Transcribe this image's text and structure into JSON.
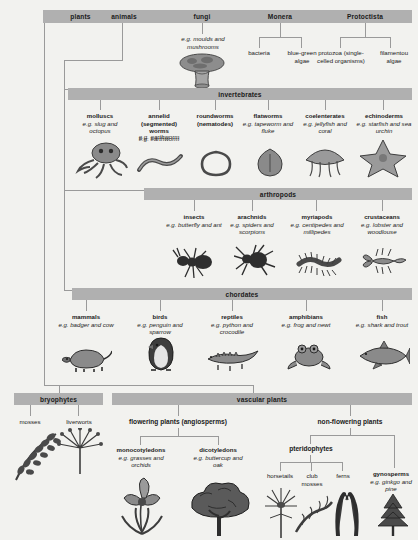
{
  "diagram": {
    "bar_color": "#b0b0b0",
    "background_color": "#f2f2ef",
    "line_color": "#9a9a9a"
  },
  "kingdoms": {
    "plants": "plants",
    "animals": "animals",
    "fungi": "fungi",
    "monera": "Monera",
    "protoctista": "Protoctista"
  },
  "fungi": {
    "example": "e.g. moulds and mushrooms",
    "art": "mushroom-illustration"
  },
  "monera": {
    "children": [
      {
        "name": "bacteria"
      },
      {
        "name": "blue-green algae"
      }
    ]
  },
  "protoctista": {
    "children": [
      {
        "name": "protozoa (single-celled organisms)"
      },
      {
        "name": "filamentou algae"
      }
    ]
  },
  "invertebrates": {
    "heading": "invertebrates",
    "groups": [
      {
        "name": "molluscs",
        "example": "e.g. slug and octopus",
        "art": "octopus-illustration"
      },
      {
        "name": "annelid (segmented) worms",
        "example": "e.g. earthworm",
        "art": "earthworm-illustration"
      },
      {
        "name": "roundworms (nematodes)",
        "example": "",
        "art": "roundworm-illustration"
      },
      {
        "name": "flatworms",
        "example": "e.g. tapeworm and fluke",
        "art": "flatworm-illustration"
      },
      {
        "name": "coelenterates",
        "example": "e.g. jellyfish and coral",
        "art": "jellyfish-illustration"
      },
      {
        "name": "echinoderms",
        "example": "e.g. starfish and sea urchin",
        "art": "starfish-illustration"
      }
    ]
  },
  "arthropods": {
    "heading": "arthropods",
    "groups": [
      {
        "name": "insects",
        "example": "e.g. butterfly and ant",
        "art": "ant-illustration"
      },
      {
        "name": "arachnids",
        "example": "e.g. spiders and scorpions",
        "art": "spider-illustration"
      },
      {
        "name": "myriapods",
        "example": "e.g. centipedes and millipedes",
        "art": "centipede-illustration"
      },
      {
        "name": "crustaceans",
        "example": "e.g. lobster and woodlouse",
        "art": "lobster-illustration"
      }
    ]
  },
  "chordates": {
    "heading": "chordates",
    "groups": [
      {
        "name": "mammals",
        "example": "e.g. badger and cow",
        "art": "badger-illustration"
      },
      {
        "name": "birds",
        "example": "e.g. penguin and sparrow",
        "art": "penguin-illustration"
      },
      {
        "name": "reptiles",
        "example": "e.g. python and crocodile",
        "art": "crocodile-illustration"
      },
      {
        "name": "amphibians",
        "example": "e.g. frog and newt",
        "art": "frog-illustration"
      },
      {
        "name": "fish",
        "example": "e.g. shark and trout",
        "art": "shark-illustration"
      }
    ]
  },
  "plants_section": {
    "bryophytes": {
      "heading": "bryophytes",
      "groups": [
        {
          "name": "mosses",
          "art": "moss-illustration"
        },
        {
          "name": "liverworts",
          "art": "liverwort-illustration"
        }
      ]
    },
    "vascular": {
      "heading": "vascular plants",
      "flowering": {
        "heading": "flowering plants (angiosperms)",
        "groups": [
          {
            "name": "monocotyledons",
            "example": "e.g. grasses and orchids",
            "art": "orchid-illustration"
          },
          {
            "name": "dicotyledons",
            "example": "e.g. buttercup and oak",
            "art": "oak-tree-illustration"
          }
        ]
      },
      "non_flowering": {
        "heading": "non-flowering plants",
        "pteridophytes": {
          "heading": "pteridophytes",
          "groups": [
            {
              "name": "horsetails",
              "art": "horsetail-illustration"
            },
            {
              "name": "club mosses",
              "art": "clubmoss-illustration"
            },
            {
              "name": "ferns",
              "art": "fern-illustration"
            }
          ]
        },
        "gymnosperms": {
          "name": "gynosperms",
          "example": "e.g. ginkgo and pine",
          "art": "pine-illustration"
        }
      }
    }
  }
}
